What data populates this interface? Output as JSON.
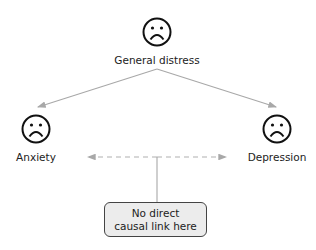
{
  "nodes": {
    "top": {
      "label": "General distress",
      "icon": "sad-face-icon"
    },
    "left": {
      "label": "Anxiety",
      "icon": "sad-face-icon"
    },
    "right": {
      "label": "Depression",
      "icon": "sad-face-icon"
    }
  },
  "note": {
    "line1": "No direct",
    "line2": "causal link here"
  },
  "colors": {
    "arrow": "#a8a8a8",
    "face": "#111111",
    "box_fill": "#ececec",
    "box_border": "#444444"
  }
}
